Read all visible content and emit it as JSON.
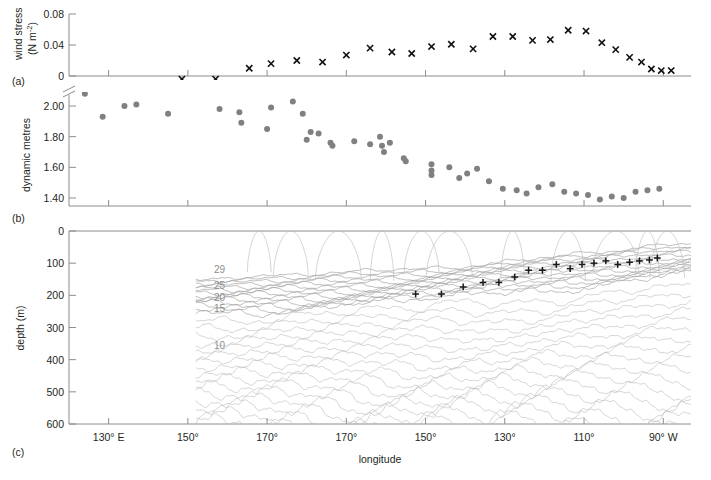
{
  "figure": {
    "xlabel": "longitude",
    "panels": [
      {
        "letter": "(a)"
      },
      {
        "letter": "(b)"
      },
      {
        "letter": "(c)"
      }
    ],
    "x_axis": {
      "label": "longitude",
      "ticks": [
        {
          "label": "130° E",
          "lon": 130
        },
        {
          "label": "150°",
          "lon": 150
        },
        {
          "label": "170°",
          "lon": 170
        },
        {
          "label": "170°",
          "lon": 190
        },
        {
          "label": "150°",
          "lon": 210
        },
        {
          "label": "130°",
          "lon": 230
        },
        {
          "label": "110°",
          "lon": 250
        },
        {
          "label": "90° W",
          "lon": 270
        }
      ],
      "range": [
        120,
        277
      ]
    }
  },
  "chart_data": [
    {
      "type": "scatter",
      "panel": "(a)",
      "title": "",
      "ylabel": "wind stress (N m-2)",
      "ylabel_line1": "wind stress",
      "ylabel_line2": "(N m",
      "ylabel_exp": "-2",
      "ylabel_line2_end": ")",
      "xlabel": "longitude",
      "yticks": [
        "0.08",
        "0.04",
        "0"
      ],
      "ytickvals": [
        0.08,
        0.04,
        0
      ],
      "ylim": [
        -0.012,
        0.088
      ],
      "marker": "x",
      "marker_color": "#111111",
      "x": [
        148.5,
        157.0,
        165.5,
        171.0,
        177.5,
        184.0,
        190.0,
        196.0,
        201.5,
        206.5,
        211.5,
        216.5,
        222.0,
        227.0,
        232.0,
        237.0,
        241.5,
        246.0,
        250.5,
        254.5,
        258.0,
        261.5,
        264.5,
        267.0,
        269.5,
        272.0
      ],
      "values": [
        -0.004,
        -0.004,
        0.01,
        0.016,
        0.02,
        0.018,
        0.027,
        0.036,
        0.031,
        0.029,
        0.038,
        0.041,
        0.035,
        0.051,
        0.051,
        0.046,
        0.047,
        0.059,
        0.058,
        0.043,
        0.034,
        0.024,
        0.018,
        0.009,
        0.007,
        0.007
      ]
    },
    {
      "type": "scatter",
      "panel": "(b)",
      "title": "",
      "ylabel": "dynamic metres",
      "xlabel": "longitude",
      "yticks": [
        "2.00",
        "1.80",
        "1.60",
        "1.40"
      ],
      "ytickvals": [
        2.0,
        1.8,
        1.6,
        1.4
      ],
      "ylim": [
        1.31,
        2.12
      ],
      "axis_break": true,
      "marker": "circle",
      "marker_color": "#808080",
      "x": [
        124.0,
        128.5,
        134.0,
        137.0,
        145.0,
        158.0,
        163.0,
        163.5,
        170.0,
        171.0,
        176.5,
        179.0,
        180.0,
        181.0,
        183.0,
        186.0,
        186.5,
        192.0,
        196.0,
        198.5,
        199.0,
        199.5,
        201.0,
        204.5,
        205.0,
        211.5,
        211.5,
        211.5,
        216.0,
        218.5,
        220.5,
        223.0,
        226.0,
        229.5,
        233.0,
        235.5,
        238.5,
        242.0,
        245.0,
        248.0,
        251.0,
        254.0,
        257.0,
        260.0,
        263.0,
        266.0,
        269.0
      ],
      "values": [
        2.08,
        1.93,
        2.0,
        2.01,
        1.95,
        1.98,
        1.96,
        1.89,
        1.85,
        1.99,
        2.03,
        1.95,
        1.78,
        1.83,
        1.82,
        1.76,
        1.74,
        1.77,
        1.75,
        1.8,
        1.74,
        1.7,
        1.76,
        1.66,
        1.64,
        1.62,
        1.58,
        1.55,
        1.6,
        1.53,
        1.56,
        1.59,
        1.51,
        1.46,
        1.45,
        1.43,
        1.47,
        1.49,
        1.44,
        1.43,
        1.42,
        1.39,
        1.41,
        1.4,
        1.44,
        1.45,
        1.46
      ]
    },
    {
      "type": "line",
      "panel": "(c)",
      "title": "",
      "ylabel": "depth (m)",
      "xlabel": "longitude",
      "yticks": [
        "0",
        "100",
        "200",
        "300",
        "400",
        "500",
        "600"
      ],
      "ytickvals": [
        0,
        100,
        200,
        300,
        400,
        500,
        600
      ],
      "ylim": [
        0,
        600
      ],
      "y_inverted": true,
      "contour_labels": [
        {
          "text": "29",
          "lon": 158,
          "depth": 118
        },
        {
          "text": "25",
          "lon": 158,
          "depth": 168
        },
        {
          "text": "20",
          "lon": 158,
          "depth": 205
        },
        {
          "text": "15",
          "lon": 158,
          "depth": 238
        },
        {
          "text": "10",
          "lon": 158,
          "depth": 353
        }
      ],
      "thermocline_marker": "+",
      "thermocline_x": [
        207.5,
        214.0,
        219.5,
        224.5,
        228.5,
        232.5,
        236.0,
        239.5,
        243.0,
        246.5,
        249.5,
        252.5,
        255.5,
        258.5,
        261.5,
        264.0,
        266.5,
        268.5
      ],
      "thermocline_depth": [
        196,
        196,
        174,
        160,
        160,
        143,
        122,
        122,
        104,
        117,
        104,
        100,
        93,
        104,
        97,
        93,
        90,
        84
      ]
    }
  ]
}
